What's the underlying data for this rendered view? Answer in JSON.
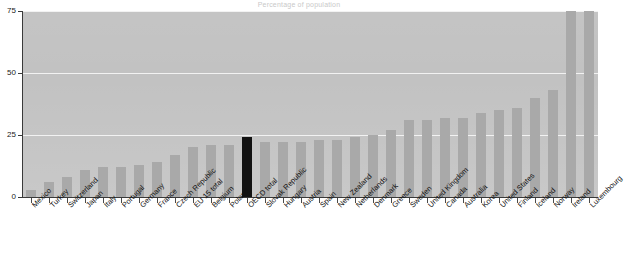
{
  "chart_data": {
    "type": "bar",
    "title": "Percentage of population",
    "xlabel": "",
    "ylabel": "",
    "ylim": [
      0,
      75
    ],
    "yticks": [
      0,
      25,
      50,
      75
    ],
    "ytick_labels": [
      "0",
      "25",
      "50",
      "75"
    ],
    "grid": true,
    "legend": "none",
    "highlight_category": "OECD total",
    "colors": {
      "bar": "#a9a9a9",
      "highlight_bar": "#121212",
      "plot_background": "#c2c2c2",
      "gridline": "#f2f2f2",
      "axis": "#3a3a3a",
      "page_background": "#ffffff",
      "label_text": "#111111"
    },
    "categories": [
      "Mexico",
      "Turkey",
      "Switzerland",
      "Japan",
      "Italy",
      "Portugal",
      "Germany",
      "France",
      "Czech Republic",
      "EU 15 total",
      "Belgium",
      "Poland",
      "OECD total",
      "Slovak Republic",
      "Hungary",
      "Austria",
      "Spain",
      "New Zealand",
      "Netherlands",
      "Denmark",
      "Greece",
      "Sweden",
      "United Kingdom",
      "Canada",
      "Australia",
      "Korea",
      "United States",
      "Finland",
      "Iceland",
      "Norway",
      "Ireland",
      "Luxembourg"
    ],
    "values": [
      3,
      6,
      8,
      11,
      12,
      12,
      13,
      14,
      17,
      20,
      21,
      21,
      24,
      22,
      22,
      22,
      23,
      23,
      24,
      25,
      27,
      31,
      31,
      32,
      32,
      34,
      35,
      36,
      40,
      43,
      75,
      75
    ]
  }
}
